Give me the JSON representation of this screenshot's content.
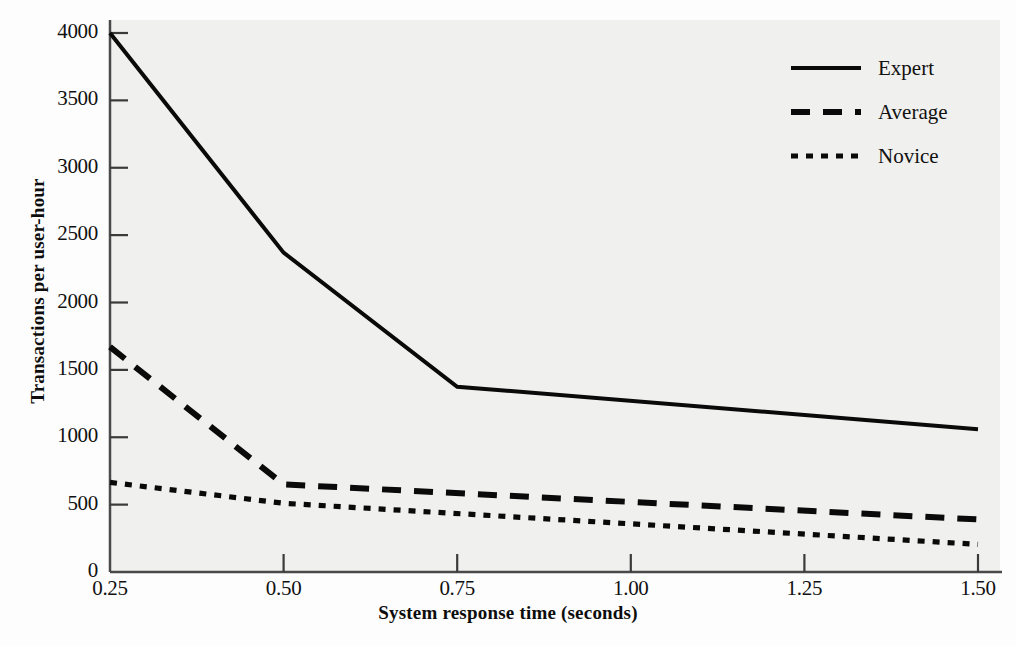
{
  "chart_data": {
    "type": "line",
    "title": "",
    "xlabel": "System response time (seconds)",
    "ylabel": "Transactions per user-hour",
    "xlim": [
      0.25,
      1.5
    ],
    "ylim": [
      0,
      4000
    ],
    "grid": false,
    "legend_position": "top-right",
    "x_ticks": [
      "0.25",
      "0.50",
      "0.75",
      "1.00",
      "1.25",
      "1.50"
    ],
    "x_tick_values": [
      0.25,
      0.5,
      0.75,
      1.0,
      1.25,
      1.5
    ],
    "y_ticks": [
      "0",
      "500",
      "1000",
      "1500",
      "2000",
      "2500",
      "3000",
      "3500",
      "4000"
    ],
    "y_tick_values": [
      0,
      500,
      1000,
      1500,
      2000,
      2500,
      3000,
      3500,
      4000
    ],
    "series": [
      {
        "name": "Expert",
        "style": "solid",
        "color": "#0a0a0a",
        "x": [
          0.25,
          0.5,
          0.75,
          1.5
        ],
        "values": [
          4000,
          2370,
          1375,
          1060
        ]
      },
      {
        "name": "Average",
        "style": "dashed",
        "color": "#0a0a0a",
        "x": [
          0.25,
          0.5,
          1.5
        ],
        "values": [
          1670,
          650,
          390
        ]
      },
      {
        "name": "Novice",
        "style": "dotted",
        "color": "#0a0a0a",
        "x": [
          0.25,
          0.5,
          1.5
        ],
        "values": [
          665,
          510,
          205
        ]
      }
    ]
  },
  "legend": {
    "items": [
      {
        "label": "Expert"
      },
      {
        "label": "Average"
      },
      {
        "label": "Novice"
      }
    ]
  },
  "axes": {
    "y_label": "Transactions per user-hour",
    "x_label": "System response time (seconds)"
  }
}
